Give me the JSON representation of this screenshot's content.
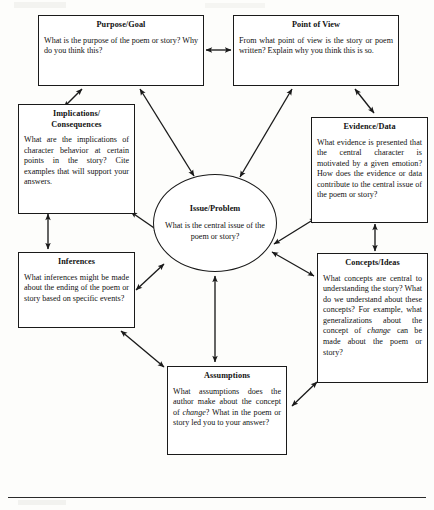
{
  "diagram": {
    "center": {
      "id": "issue-problem",
      "title": "Issue/Problem",
      "body": "What is the central issue of the poem or story?"
    },
    "nodes": [
      {
        "id": "purpose-goal",
        "title": "Purpose/Goal",
        "body": "What is the purpose of the poem or story? Why do you think this?"
      },
      {
        "id": "point-of-view",
        "title": "Point of View",
        "body": "From what point of view is the story or poem written? Explain why you think this is so."
      },
      {
        "id": "implications-consequences",
        "title": "Implications/ Consequences",
        "title_line1": "Implications/",
        "title_line2": "Consequences",
        "body": "What are the implications of character behavior at certain points in the story? Cite examples that will support your answers."
      },
      {
        "id": "evidence-data",
        "title": "Evidence/Data",
        "body": "What evidence is presented that the central character is motivated by a given emotion? How does the evidence or data contribute to the central issue of the poem or story?"
      },
      {
        "id": "inferences",
        "title": "Inferences",
        "body": "What inferences might be made about the ending of the poem or story based on specific events?"
      },
      {
        "id": "concepts-ideas",
        "title": "Concepts/Ideas",
        "body_part1": "What concepts are central to understanding the story? What do we understand about these concepts? For example, what generalizations about the concept of ",
        "body_emphasis": "change",
        "body_part2": " can be made about the poem or story?"
      },
      {
        "id": "assumptions",
        "title": "Assumptions",
        "body_part1": "What assumptions does the author make about the concept of ",
        "body_emphasis": "change",
        "body_part2": "? What in the poem or story led you to your answer?"
      }
    ],
    "connections": [
      {
        "from": "purpose-goal",
        "to": "point-of-view",
        "style": "double-headed"
      },
      {
        "from": "purpose-goal",
        "to": "implications-consequences",
        "style": "double-headed"
      },
      {
        "from": "purpose-goal",
        "to": "issue-problem",
        "style": "double-headed"
      },
      {
        "from": "point-of-view",
        "to": "evidence-data",
        "style": "double-headed"
      },
      {
        "from": "point-of-view",
        "to": "issue-problem",
        "style": "double-headed"
      },
      {
        "from": "implications-consequences",
        "to": "issue-problem",
        "style": "double-headed"
      },
      {
        "from": "implications-consequences",
        "to": "inferences",
        "style": "double-headed"
      },
      {
        "from": "evidence-data",
        "to": "issue-problem",
        "style": "double-headed"
      },
      {
        "from": "evidence-data",
        "to": "concepts-ideas",
        "style": "double-headed"
      },
      {
        "from": "inferences",
        "to": "issue-problem",
        "style": "double-headed"
      },
      {
        "from": "inferences",
        "to": "assumptions",
        "style": "double-headed"
      },
      {
        "from": "concepts-ideas",
        "to": "issue-problem",
        "style": "double-headed"
      },
      {
        "from": "concepts-ideas",
        "to": "assumptions",
        "style": "double-headed"
      },
      {
        "from": "assumptions",
        "to": "issue-problem",
        "style": "double-headed"
      }
    ],
    "colors": {
      "stroke": "#1a1a1a",
      "box_fill": "#ffffff",
      "page_background": "#fdfdfb",
      "text": "#111111"
    }
  }
}
